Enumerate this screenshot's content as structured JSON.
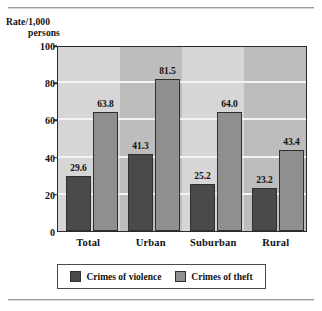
{
  "chart_data": {
    "type": "bar",
    "title": "",
    "xlabel": "",
    "ylabel_line1": "Rate/1,000",
    "ylabel_line2": "persons",
    "categories": [
      "Total",
      "Urban",
      "Suburban",
      "Rural"
    ],
    "series": [
      {
        "name": "Crimes of violence",
        "color": "#4a4a4a",
        "values": [
          29.6,
          41.3,
          25.2,
          23.2
        ],
        "labels": [
          "29.6",
          "41.3",
          "25.2",
          "23.2"
        ]
      },
      {
        "name": "Crimes of theft",
        "color": "#8f8f8f",
        "values": [
          63.8,
          81.5,
          64.0,
          43.4
        ],
        "labels": [
          "63.8",
          "81.5",
          "64.0",
          "43.4"
        ]
      }
    ],
    "ylim": [
      0,
      100
    ],
    "yticks": [
      0,
      20,
      40,
      60,
      80,
      100
    ],
    "ytick_labels": [
      "0",
      "20",
      "40",
      "60",
      "80",
      "100"
    ],
    "grid": true,
    "grid_orientation": "horizontal",
    "grid_color": "#f4f4f4",
    "plot_background": "#c6c6c6",
    "band_colors": [
      "#d6d6d6",
      "#bdbdbd"
    ],
    "legend_position": "bottom-center"
  },
  "legend": {
    "items": [
      {
        "label": "Crimes of violence",
        "color": "#4a4a4a"
      },
      {
        "label": "Crimes of theft",
        "color": "#8f8f8f"
      }
    ]
  }
}
